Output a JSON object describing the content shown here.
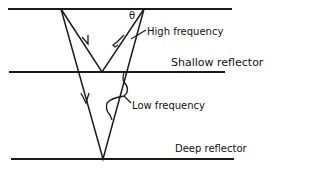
{
  "labels": {
    "theta": "θ",
    "high_frequency": "High frequency",
    "shallow_reflector": "Shallow reflector",
    "low_frequency": "Low frequency",
    "deep_reflector": "Deep reflector"
  },
  "colors": {
    "line": "#1a1a1a",
    "background": "#ffffff"
  }
}
